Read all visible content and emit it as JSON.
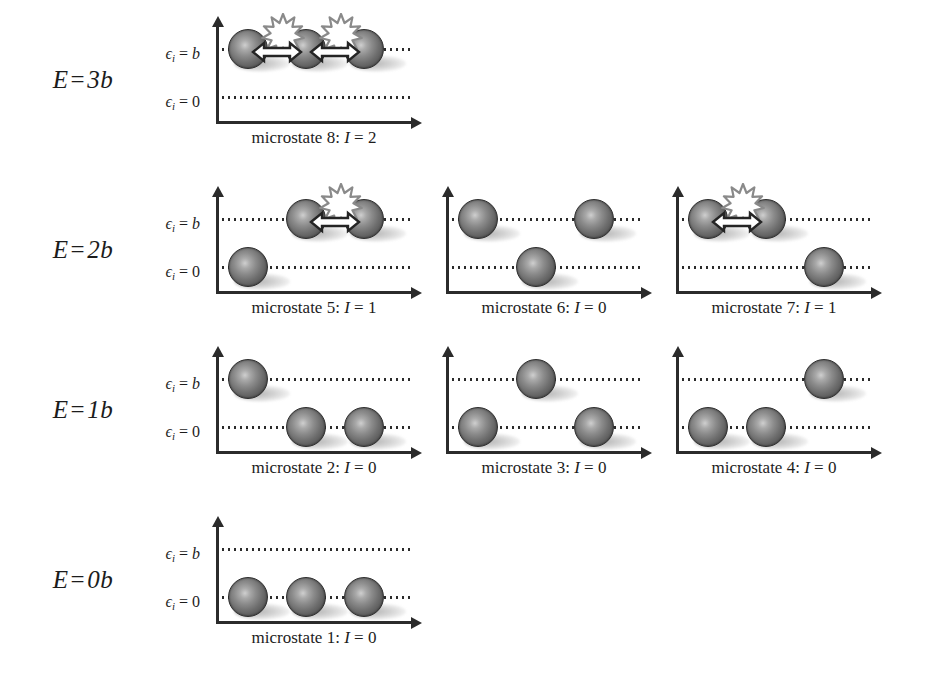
{
  "figure": {
    "axis": {
      "level_high_label": "ϵ",
      "level_high_sub": "i",
      "level_high_value": "b",
      "level_low_label": "ϵ",
      "level_low_sub": "i",
      "level_low_value": "0",
      "eq": "="
    },
    "colors": {
      "ball_dark": "#3f3f3f",
      "ball_light": "#cfcfcf",
      "axis": "#2b2b2b",
      "text": "#1c1c1c",
      "background": "#ffffff",
      "starburst_fill": "#ffffff",
      "starburst_stroke": "#8a8a8a",
      "arrow_fill": "#ffffff",
      "arrow_stroke": "#242424"
    }
  },
  "rows": [
    {
      "energy_label": "E",
      "energy_eq": "=",
      "energy_value": "3",
      "energy_unit": "b",
      "energy_full": "E = 3b",
      "top": 20,
      "panels": [
        {
          "caption_prefix": "microstate 8:",
          "caption_var": "I",
          "caption_eq": "=",
          "caption_value": "2",
          "caption_full": "microstate 8: I = 2",
          "microstate": 8,
          "interactions": 2,
          "energy": "3b",
          "occupancy": [
            "b",
            "b",
            "b"
          ],
          "bonds": [
            [
              0,
              1
            ],
            [
              1,
              2
            ]
          ]
        }
      ]
    },
    {
      "energy_label": "E",
      "energy_eq": "=",
      "energy_value": "2",
      "energy_unit": "b",
      "energy_full": "E = 2b",
      "top": 190,
      "panels": [
        {
          "caption_prefix": "microstate 5:",
          "caption_var": "I",
          "caption_eq": "=",
          "caption_value": "1",
          "caption_full": "microstate 5: I = 1",
          "microstate": 5,
          "interactions": 1,
          "energy": "2b",
          "occupancy": [
            "0",
            "b",
            "b"
          ],
          "bonds": [
            [
              1,
              2
            ]
          ]
        },
        {
          "caption_prefix": "microstate 6:",
          "caption_var": "I",
          "caption_eq": "=",
          "caption_value": "0",
          "caption_full": "microstate 6: I = 0",
          "microstate": 6,
          "interactions": 0,
          "energy": "2b",
          "occupancy": [
            "b",
            "0",
            "b"
          ],
          "bonds": []
        },
        {
          "caption_prefix": "microstate 7:",
          "caption_var": "I",
          "caption_eq": "=",
          "caption_value": "1",
          "caption_full": "microstate 7: I = 1",
          "microstate": 7,
          "interactions": 1,
          "energy": "2b",
          "occupancy": [
            "b",
            "b",
            "0"
          ],
          "bonds": [
            [
              0,
              1
            ]
          ]
        }
      ]
    },
    {
      "energy_label": "E",
      "energy_eq": "=",
      "energy_value": "1",
      "energy_unit": "b",
      "energy_full": "E = 1b",
      "top": 350,
      "panels": [
        {
          "caption_prefix": "microstate 2:",
          "caption_var": "I",
          "caption_eq": "=",
          "caption_value": "0",
          "caption_full": "microstate 2: I = 0",
          "microstate": 2,
          "interactions": 0,
          "energy": "1b",
          "occupancy": [
            "b",
            "0",
            "0"
          ],
          "bonds": []
        },
        {
          "caption_prefix": "microstate 3:",
          "caption_var": "I",
          "caption_eq": "=",
          "caption_value": "0",
          "caption_full": "microstate 3: I = 0",
          "microstate": 3,
          "interactions": 0,
          "energy": "1b",
          "occupancy": [
            "0",
            "b",
            "0"
          ],
          "bonds": []
        },
        {
          "caption_prefix": "microstate 4:",
          "caption_var": "I",
          "caption_eq": "=",
          "caption_value": "0",
          "caption_full": "microstate 4: I = 0",
          "microstate": 4,
          "interactions": 0,
          "energy": "1b",
          "occupancy": [
            "0",
            "0",
            "b"
          ],
          "bonds": []
        }
      ]
    },
    {
      "energy_label": "E",
      "energy_eq": "=",
      "energy_value": "0",
      "energy_unit": "b",
      "energy_full": "E = 0b",
      "top": 520,
      "panels": [
        {
          "caption_prefix": "microstate 1:",
          "caption_var": "I",
          "caption_eq": "=",
          "caption_value": "0",
          "caption_full": "microstate 1: I = 0",
          "microstate": 1,
          "interactions": 0,
          "energy": "0b",
          "occupancy": [
            "0",
            "0",
            "0"
          ],
          "bonds": []
        }
      ]
    }
  ]
}
